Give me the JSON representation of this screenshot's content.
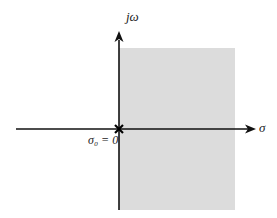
{
  "diagram": {
    "axes": {
      "vertical_label": "jω",
      "horizontal_label": "σ",
      "origin_label": "σ₀ = 0"
    },
    "region": {
      "description": "shaded right half-plane",
      "fill": "#dcdcdc"
    },
    "marker": "×",
    "colors": {
      "axis": "#111111",
      "shade": "#dcdcdc"
    }
  }
}
